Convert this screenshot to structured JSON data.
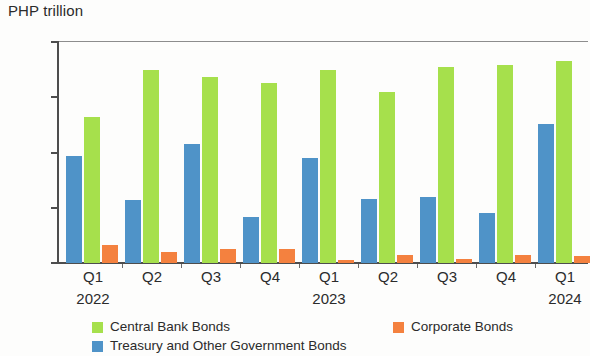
{
  "chart_data": {
    "type": "bar",
    "title": "",
    "ylabel": "PHP trillion",
    "xlabel": "",
    "ylim": [
      0.0,
      2.0
    ],
    "yticks": [
      "0.0",
      "0.5",
      "1.0",
      "1.5",
      "2.0"
    ],
    "ytick_values": [
      0.0,
      0.5,
      1.0,
      1.5,
      2.0
    ],
    "grid": false,
    "legend_position": "bottom",
    "categories": [
      "Q1",
      "Q2",
      "Q3",
      "Q4",
      "Q1",
      "Q2",
      "Q3",
      "Q4",
      "Q1"
    ],
    "group_years": [
      "2022",
      "",
      "",
      "",
      "2023",
      "",
      "",
      "",
      "2024"
    ],
    "series": [
      {
        "name": "Treasury and Other Government Bonds",
        "color": "#4f93c8",
        "values": [
          0.97,
          0.57,
          1.08,
          0.42,
          0.95,
          0.58,
          0.6,
          0.45,
          1.26
        ]
      },
      {
        "name": "Central Bank Bonds",
        "color": "#a6e04c",
        "values": [
          1.32,
          1.75,
          1.68,
          1.63,
          1.75,
          1.55,
          1.77,
          1.79,
          1.83
        ]
      },
      {
        "name": "Corporate Bonds",
        "color": "#f4813f",
        "values": [
          0.16,
          0.1,
          0.13,
          0.13,
          0.03,
          0.07,
          0.04,
          0.07,
          0.06
        ]
      }
    ]
  },
  "legend": {
    "central_bank_bonds": "Central Bank Bonds",
    "corporate_bonds": "Corporate Bonds",
    "treasury_bonds": "Treasury and Other Government Bonds"
  }
}
